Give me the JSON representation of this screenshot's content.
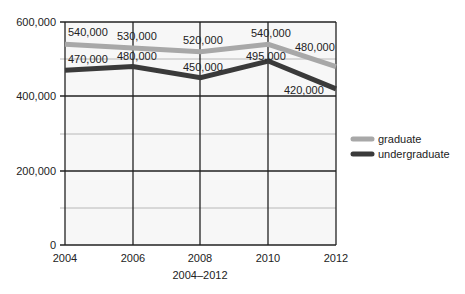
{
  "chart_data": {
    "type": "line",
    "title": "",
    "xlabel": "2004–2012",
    "ylabel": "",
    "categories": [
      "2004",
      "2006",
      "2008",
      "2010",
      "2012"
    ],
    "ylim": [
      0,
      600000
    ],
    "yticks": [
      "0",
      "200,000",
      "400,000",
      "600,000"
    ],
    "grid": true,
    "legend_position": "right",
    "series": [
      {
        "name": "graduate",
        "color": "#a8a8a8",
        "values": [
          540000,
          530000,
          520000,
          540000,
          480000
        ],
        "labels": [
          "540,000",
          "530,000",
          "520,000",
          "540,000",
          "480,000"
        ]
      },
      {
        "name": "undergraduate",
        "color": "#3a3a3a",
        "values": [
          470000,
          480000,
          450000,
          495000,
          420000
        ],
        "labels": [
          "470,000",
          "480,000",
          "450,000",
          "495,000",
          "420,000"
        ]
      }
    ]
  }
}
